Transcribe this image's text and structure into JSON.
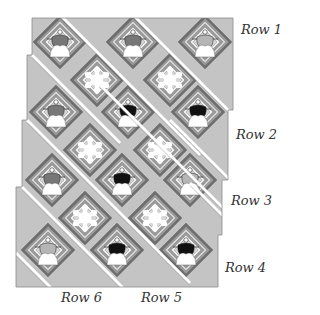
{
  "row_labels": [
    "Row 1",
    "Row 2",
    "Row 3",
    "Row 4",
    "Row 5",
    "Row 6"
  ],
  "colors": {
    "background_fabric": "#c4c4c4",
    "sashing": "#ffffff",
    "log_dark": "#6e6e6e",
    "log_medium": "#9a9a9a",
    "log_light": "#d6d6d6",
    "log_pale": "#eeeeee",
    "angel_robe": "#ffffff",
    "angel_black": "#111111",
    "angel_gray": "#777777",
    "angel_light": "#b5b5b5",
    "snowflake": "#ffffff"
  },
  "blocks": {
    "angels": [
      {
        "row": 1,
        "col": 1,
        "wing_tone": "gray"
      },
      {
        "row": 1,
        "col": 2,
        "wing_tone": "gray"
      },
      {
        "row": 1,
        "col": 3,
        "wing_tone": "light"
      },
      {
        "row": 2,
        "col": 1,
        "wing_tone": "gray"
      },
      {
        "row": 2,
        "col": 2,
        "wing_tone": "black"
      },
      {
        "row": 2,
        "col": 3,
        "wing_tone": "black"
      },
      {
        "row": 3,
        "col": 1,
        "wing_tone": "gray"
      },
      {
        "row": 3,
        "col": 2,
        "wing_tone": "black"
      },
      {
        "row": 3,
        "col": 3,
        "wing_tone": "light"
      },
      {
        "row": 4,
        "col": 1,
        "wing_tone": "light"
      },
      {
        "row": 4,
        "col": 2,
        "wing_tone": "black"
      },
      {
        "row": 4,
        "col": 3,
        "wing_tone": "black"
      }
    ],
    "snowflakes": [
      {
        "row": 1,
        "col": 1
      },
      {
        "row": 1,
        "col": 2
      },
      {
        "row": 2,
        "col": 1
      },
      {
        "row": 2,
        "col": 2
      },
      {
        "row": 3,
        "col": 1
      },
      {
        "row": 3,
        "col": 2
      }
    ]
  }
}
